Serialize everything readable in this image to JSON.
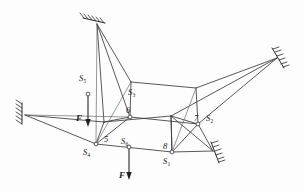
{
  "figure": {
    "type": "engineering-line-diagram",
    "colors": {
      "line": "#3a3a3a",
      "line_light": "#6b6b6b",
      "support": "#2e2e2e",
      "text": "#1a1a1a",
      "background": "#fdfdfd"
    }
  },
  "labels": {
    "bar_s1": "S",
    "bar_s1_sub": "1",
    "bar_s2": "S",
    "bar_s2_sub": "2",
    "bar_s3": "S",
    "bar_s3_sub": "3",
    "bar_s4": "S",
    "bar_s4_sub": "4",
    "bar_s5": "S",
    "bar_s5_sub": "5",
    "bar_s6": "S",
    "bar_s6_sub": "6",
    "node_5": "5",
    "node_6": "6",
    "node_7": "7",
    "node_8": "8",
    "force_left": "F",
    "force_bottom": "F"
  },
  "nodes": [
    {
      "id": "5",
      "label": "5",
      "x": 96,
      "y": 144,
      "type": "lower-front-left"
    },
    {
      "id": "6",
      "label": "6",
      "x": 130,
      "y": 117,
      "type": "upper-front-left"
    },
    {
      "id": "7",
      "label": "7",
      "x": 198,
      "y": 124,
      "type": "upper-front-right"
    },
    {
      "id": "8",
      "label": "8",
      "x": 172,
      "y": 152,
      "type": "lower-front-right"
    },
    {
      "id": "A",
      "label": "",
      "x": 131,
      "y": 82,
      "type": "upper-back-left"
    },
    {
      "id": "B",
      "label": "",
      "x": 196,
      "y": 88,
      "type": "upper-back-right"
    },
    {
      "id": "C",
      "label": "",
      "x": 171,
      "y": 116,
      "type": "lower-back-right"
    },
    {
      "id": "D",
      "label": "",
      "x": 104,
      "y": 122,
      "type": "lower-back-left"
    }
  ],
  "supports": [
    {
      "id": "support-top",
      "x": 93,
      "y": 20,
      "orientation": "upper-left-wall"
    },
    {
      "id": "support-right",
      "x": 281,
      "y": 56,
      "orientation": "upper-right-wall"
    },
    {
      "id": "support-left",
      "x": 21,
      "y": 113,
      "orientation": "vertical-left-wall"
    },
    {
      "id": "support-bottom-right",
      "x": 216,
      "y": 152,
      "orientation": "lower-right-wall"
    }
  ],
  "forces": [
    {
      "id": "force-left",
      "label": "F",
      "tail_x": 88,
      "tail_y": 94,
      "head_x": 88,
      "head_y": 126,
      "direction": "down"
    },
    {
      "id": "force-bottom",
      "label": "F",
      "tail_x": 129,
      "tail_y": 147,
      "head_x": 129,
      "head_y": 180,
      "direction": "down"
    }
  ],
  "bar_labels": [
    {
      "id": "S1",
      "base": "S",
      "sub": "1",
      "x": 166,
      "y": 161
    },
    {
      "id": "S2",
      "base": "S",
      "sub": "2",
      "x": 207,
      "y": 119
    },
    {
      "id": "S3",
      "base": "S",
      "sub": "3",
      "x": 132,
      "y": 95
    },
    {
      "id": "S4",
      "base": "S",
      "sub": "4",
      "x": 87,
      "y": 150
    },
    {
      "id": "S5",
      "base": "S",
      "sub": "5",
      "x": 82,
      "y": 83
    },
    {
      "id": "S6",
      "base": "S",
      "sub": "6",
      "x": 124,
      "y": 139
    }
  ]
}
